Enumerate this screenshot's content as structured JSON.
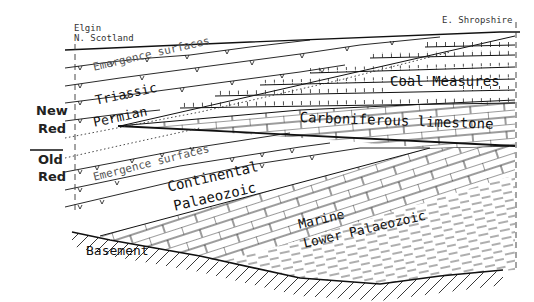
{
  "locations": {
    "left": "Elgin\nN. Scotland",
    "left_line1": "Elgin",
    "left_line2": "N. Scotland",
    "right": "E. Shropshire"
  },
  "side_labels": {
    "new_red_1": "New",
    "new_red_2": "Red",
    "old_red_1": "Old",
    "old_red_2": "Red"
  },
  "units": {
    "emergence_upper": "Emergence surfaces",
    "triassic": "Triassic",
    "permian": "Permian",
    "coal_measures": "Coal Measures",
    "carboniferous_limestone": "Carboniferous limestone",
    "emergence_lower": "Emergence surfaces",
    "continental_1": "Continental",
    "continental_2": "Palaeozoic",
    "marine_1": "Marine",
    "marine_2": "Lower Palaeozoic",
    "basement": "Basement"
  },
  "colors": {
    "line": "#111111",
    "background": "#ffffff"
  }
}
